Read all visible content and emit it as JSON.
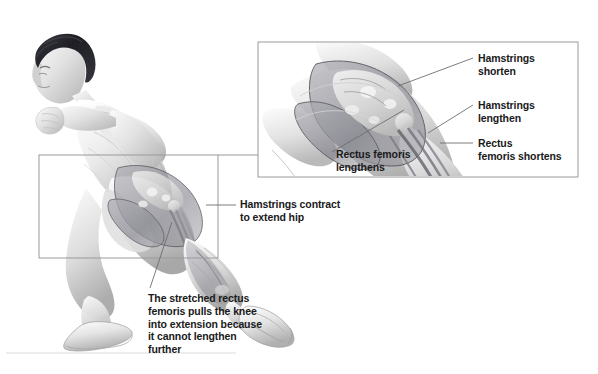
{
  "figure": {
    "type": "anatomical-illustration",
    "background_color": "#ffffff",
    "text_color": "#1a1a1a",
    "line_color": "#6e6e72",
    "box_border_color": "#9a9a9e",
    "skin_light": "#f2f2f2",
    "skin_mid": "#cfcfcf",
    "skin_shadow": "#9a9a9a",
    "hair_color": "#23232a",
    "muscle_overlay": "#8e8e96",
    "bone_color": "#e8e8e8",
    "ground_line_color": "#d9d9d9"
  },
  "inset": {
    "name": "magnified-hip-detail",
    "x": 258,
    "y": 42,
    "width": 320,
    "height": 135,
    "source_box": {
      "x": 39,
      "y": 155,
      "width": 179,
      "height": 103
    },
    "connector": {
      "x1": 218,
      "y1": 155,
      "x2": 258,
      "y2": 155
    }
  },
  "labels": [
    {
      "id": "hamstrings-shorten",
      "text": "Hamstrings\nshorten",
      "x": 478,
      "y": 52,
      "leader": {
        "x1": 473,
        "y1": 58,
        "x2": 398,
        "y2": 86
      }
    },
    {
      "id": "hamstrings-lengthen",
      "text": "Hamstrings\nlengthen",
      "x": 478,
      "y": 99,
      "leader": {
        "x1": 473,
        "y1": 105,
        "x2": 428,
        "y2": 133
      }
    },
    {
      "id": "rectus-femoris-shortens",
      "text": "Rectus\nfemoris shortens",
      "x": 478,
      "y": 137,
      "leader": {
        "x1": 473,
        "y1": 143,
        "x2": 440,
        "y2": 143
      }
    },
    {
      "id": "rectus-femoris-lengthens",
      "text": "Rectus femoris\nlengthens",
      "x": 336,
      "y": 148,
      "leader": {
        "x1": 332,
        "y1": 152,
        "x2": 404,
        "y2": 110
      }
    },
    {
      "id": "hamstrings-contract",
      "text": "Hamstrings contract\nto extend hip",
      "x": 240,
      "y": 198,
      "leader": {
        "x1": 236,
        "y1": 205,
        "x2": 206,
        "y2": 205
      }
    },
    {
      "id": "stretched-rectus-femoris",
      "text": "The stretched rectus\nfemoris pulls the knee\ninto extension because\nit cannot lengthen\nfurther",
      "x": 148,
      "y": 292,
      "leader": {
        "x1": 150,
        "y1": 288,
        "x2": 172,
        "y2": 222
      }
    }
  ]
}
